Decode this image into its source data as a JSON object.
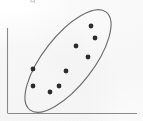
{
  "figure": {
    "name": "scatter-plot-with-ellipse",
    "caption_fragment_above": "g",
    "background_color": "#fdfdfd",
    "width": 143,
    "height": 121
  },
  "axes": {
    "line_color": "#8a8a8a",
    "line_width": 1.1,
    "y_axis": {
      "x": 7.5,
      "y_top": 28,
      "y_bottom": 113
    },
    "x_axis": {
      "y": 113.5,
      "x_left": 7.5,
      "x_right": 137
    },
    "tick_labels_x": [],
    "tick_labels_y": [],
    "xlabel": "",
    "ylabel": "",
    "grid": false
  },
  "ellipse": {
    "name": "correlation-ellipse",
    "center_x": 68,
    "center_y": 61,
    "semi_major": 62,
    "semi_minor": 25,
    "rotation_deg": -52,
    "stroke_color": "#6d6d6d",
    "stroke_width": 1.15,
    "fill": "none"
  },
  "chart_data": {
    "type": "scatter",
    "title": "",
    "subtitle": "",
    "xlabel": "",
    "ylabel": "",
    "grid": false,
    "legend": [],
    "legend_position": "none",
    "annotations": [
      {
        "kind": "ellipse",
        "label": "positive-correlation envelope",
        "center": [
          68,
          61
        ],
        "semi_axes": [
          62,
          25
        ],
        "rotation_deg": -52
      }
    ],
    "point_color": "#2c2c2c",
    "point_radius_px": 2.4,
    "axis_pixel_ranges": {
      "x": [
        7.5,
        137
      ],
      "y": [
        113.5,
        28
      ]
    },
    "xlim": [
      0,
      100
    ],
    "ylim": [
      0,
      100
    ],
    "series": [
      {
        "name": "observations",
        "marker": "filled-circle",
        "points_px": [
          [
            33,
            69
          ],
          [
            33,
            86
          ],
          [
            59,
            86
          ],
          [
            66,
            71
          ],
          [
            76,
            46
          ],
          [
            88,
            57
          ],
          [
            91,
            26
          ],
          [
            95,
            38
          ],
          [
            50,
            92
          ]
        ],
        "x": [
          19.7,
          19.7,
          39.8,
          45.2,
          52.9,
          62.2,
          64.5,
          67.6,
          32.8
        ],
        "y": [
          52.0,
          32.2,
          32.2,
          49.7,
          79.0,
          66.1,
          102.2,
          88.2,
          25.1
        ]
      }
    ],
    "n_points": 9
  }
}
